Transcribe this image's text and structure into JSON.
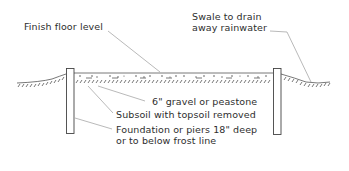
{
  "labels": {
    "finish_floor": "Finish floor level",
    "swale": [
      "Swale to drain",
      "away rainwater"
    ],
    "gravel": "6\" gravel or peastone",
    "subsoil": "Subsoil with topsoil removed",
    "foundation": [
      "Foundation or piers 18\" deep",
      "or to below frost line"
    ]
  },
  "colors": {
    "line": "#444444",
    "leader": "#8a8a8a",
    "text": "#2e2e2e"
  }
}
